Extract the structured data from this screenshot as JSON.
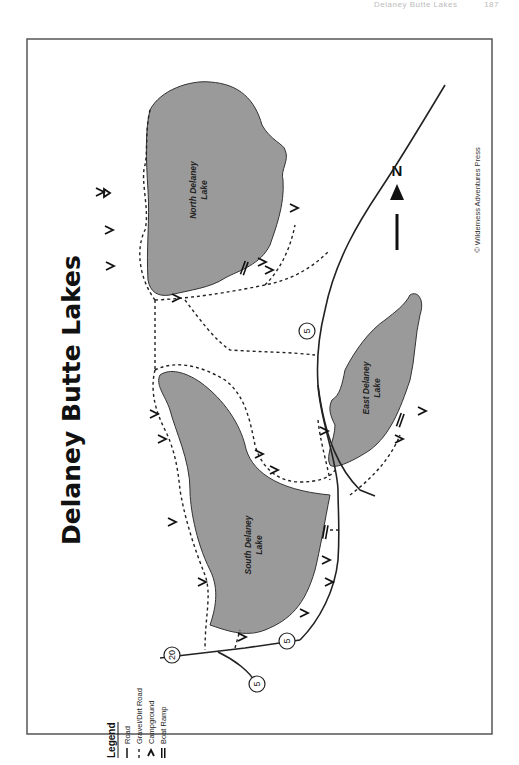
{
  "page_header": {
    "running_title": "Delaney Butte Lakes",
    "page_number": "187"
  },
  "map": {
    "title": "Delaney Butte Lakes",
    "copyright": "© Wilderness Adventures Press",
    "north_label": "N",
    "lakes": [
      {
        "name_line1": "North Delaney",
        "name_line2": "Lake"
      },
      {
        "name_line1": "South Delaney",
        "name_line2": "Lake"
      },
      {
        "name_line1": "East Delaney",
        "name_line2": "Lake"
      }
    ],
    "route_shields": [
      "20",
      "5",
      "5",
      "5"
    ],
    "legend": {
      "title": "Legend",
      "items": [
        {
          "symbol": "road",
          "label": "Road"
        },
        {
          "symbol": "gravel-dirt-road",
          "label": "Gravel/Dirt Road"
        },
        {
          "symbol": "campground",
          "label": "Campground"
        },
        {
          "symbol": "boat-ramp",
          "label": "Boat Ramp"
        }
      ]
    },
    "colors": {
      "lake_fill": "#9a9a9a",
      "frame": "#555555",
      "ink": "#111111"
    }
  }
}
